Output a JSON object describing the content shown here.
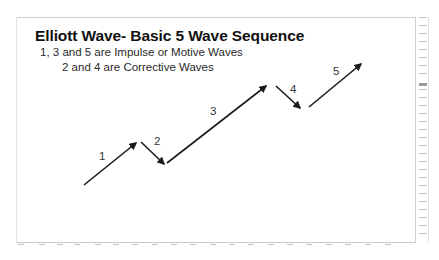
{
  "diagram": {
    "title": "Elliott Wave- Basic 5 Wave Sequence",
    "subtitle_line1": "1, 3 and 5 are Impulse or Motive Waves",
    "subtitle_line2": "2 and 4 are Corrective Waves",
    "colors": {
      "arrow": "#1a1a1a",
      "text": "#111111",
      "frame": "#cfcfcf",
      "background": "#ffffff"
    },
    "waves": [
      {
        "label": "1",
        "type": "impulse",
        "direction": "up"
      },
      {
        "label": "2",
        "type": "corrective",
        "direction": "down"
      },
      {
        "label": "3",
        "type": "impulse",
        "direction": "up"
      },
      {
        "label": "4",
        "type": "corrective",
        "direction": "down"
      },
      {
        "label": "5",
        "type": "impulse",
        "direction": "up"
      }
    ]
  }
}
